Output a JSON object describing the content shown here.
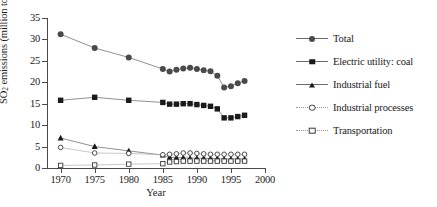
{
  "chart_data": {
    "type": "line",
    "title": "",
    "xlabel": "Year",
    "ylabel_prefix": "SO",
    "ylabel_sub": "2",
    "ylabel_suffix": " emissions (million tons/year)",
    "ylabel_full": "SO2 emissions (million tons/year)",
    "xlim": [
      1968,
      2000
    ],
    "ylim": [
      0,
      35
    ],
    "xticks": [
      1970,
      1975,
      1980,
      1985,
      1990,
      1995,
      2000
    ],
    "yticks": [
      0,
      5,
      10,
      15,
      20,
      25,
      30,
      35
    ],
    "grid": false,
    "legend_position": "right",
    "series": [
      {
        "name": "Total",
        "marker": "circle-filled",
        "color": "#4a4a4a",
        "x": [
          1970,
          1975,
          1980,
          1985,
          1986,
          1987,
          1988,
          1989,
          1990,
          1991,
          1992,
          1993,
          1994,
          1995,
          1996,
          1997
        ],
        "values": [
          31.2,
          28.0,
          25.8,
          23.1,
          22.5,
          22.9,
          23.2,
          23.4,
          23.1,
          22.8,
          22.6,
          21.5,
          18.8,
          19.1,
          19.8,
          20.3
        ]
      },
      {
        "name": "Electric utility: coal",
        "marker": "square-filled",
        "color": "#1a1a1a",
        "x": [
          1970,
          1975,
          1980,
          1985,
          1986,
          1987,
          1988,
          1989,
          1990,
          1991,
          1992,
          1993,
          1994,
          1995,
          1996,
          1997
        ],
        "values": [
          15.8,
          16.5,
          15.8,
          15.3,
          14.9,
          14.9,
          15.0,
          15.0,
          14.8,
          14.6,
          14.4,
          13.8,
          11.7,
          11.7,
          12.0,
          12.3
        ]
      },
      {
        "name": "Industrial fuel",
        "marker": "triangle-filled",
        "color": "#1a1a1a",
        "x": [
          1970,
          1975,
          1980,
          1985,
          1986,
          1987,
          1988,
          1989,
          1990,
          1991,
          1992,
          1993,
          1994,
          1995,
          1996,
          1997
        ],
        "values": [
          7.0,
          5.0,
          4.0,
          3.0,
          2.5,
          2.4,
          2.4,
          2.3,
          2.3,
          2.3,
          2.2,
          2.2,
          2.1,
          2.1,
          2.1,
          2.1
        ]
      },
      {
        "name": "Industrial processes",
        "marker": "circle-open",
        "color": "#3a3a3a",
        "x": [
          1970,
          1975,
          1980,
          1985,
          1986,
          1987,
          1988,
          1989,
          1990,
          1991,
          1992,
          1993,
          1994,
          1995,
          1996,
          1997
        ],
        "values": [
          4.8,
          3.5,
          3.4,
          3.1,
          3.2,
          3.3,
          3.5,
          3.5,
          3.4,
          3.3,
          3.2,
          3.2,
          3.2,
          3.2,
          3.2,
          3.2
        ]
      },
      {
        "name": "Transportation",
        "marker": "square-open",
        "color": "#3a3a3a",
        "x": [
          1970,
          1975,
          1980,
          1985,
          1986,
          1987,
          1988,
          1989,
          1990,
          1991,
          1992,
          1993,
          1994,
          1995,
          1996,
          1997
        ],
        "values": [
          0.6,
          0.7,
          0.9,
          1.0,
          1.4,
          1.5,
          1.6,
          1.6,
          1.6,
          1.6,
          1.6,
          1.6,
          1.6,
          1.6,
          1.6,
          1.6
        ]
      }
    ]
  },
  "axes": {
    "ytick_labels": [
      "0",
      "5",
      "10",
      "15",
      "20",
      "25",
      "30",
      "35"
    ],
    "xtick_labels": [
      "1970",
      "1975",
      "1980",
      "1985",
      "1990",
      "1995",
      "2000"
    ],
    "xlabel": "Year"
  },
  "legend": {
    "items": [
      {
        "label": "Total",
        "marker": "circle-filled"
      },
      {
        "label": "Electric utility: coal",
        "marker": "square-filled"
      },
      {
        "label": "Industrial fuel",
        "marker": "triangle-filled"
      },
      {
        "label": "Industrial processes",
        "marker": "circle-open"
      },
      {
        "label": "Transportation",
        "marker": "square-open"
      }
    ]
  }
}
